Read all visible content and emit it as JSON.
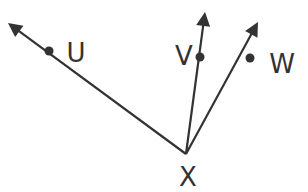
{
  "diagram": {
    "title": "",
    "stroke_color": "#333333",
    "background": "#ffffff",
    "vertex": {
      "label": "X",
      "x": 186,
      "y": 154,
      "label_x": 188,
      "label_y": 186
    },
    "rays": [
      {
        "id": "XU",
        "point_label": "U",
        "tip": [
          8,
          23
        ],
        "dot": [
          49,
          51
        ],
        "label_x": 76,
        "label_y": 62
      },
      {
        "id": "XV",
        "point_label": "V",
        "tip": [
          205,
          12
        ],
        "dot": [
          200,
          57
        ],
        "label_x": 184,
        "label_y": 65
      },
      {
        "id": "XW",
        "point_label": "W",
        "tip": [
          258,
          22
        ],
        "dot": [
          250,
          58
        ],
        "label_x": 282,
        "label_y": 73
      }
    ]
  }
}
